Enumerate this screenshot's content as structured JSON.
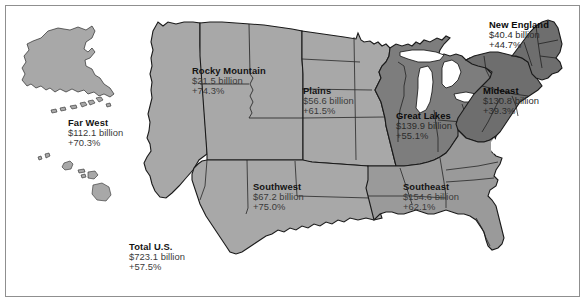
{
  "figure": {
    "type": "choropleth-map",
    "background_color": "#ffffff",
    "frame_color": "#8f8f8f"
  },
  "palette": {
    "land_light": "#a8a8a8",
    "land_mid": "#9a9a9a",
    "land_dark": "#7d7d7d",
    "land_darkest": "#6e6e6e",
    "outline": "#1a1a1a",
    "water": "#ffffff",
    "label_name": "#141414",
    "label_value": "#3a3a3a"
  },
  "regions": [
    {
      "id": "far-west",
      "name": "Far West",
      "value": "$112.1 billion",
      "percent": "+70.3%",
      "fill": "#a8a8a8",
      "label_on_dark": false
    },
    {
      "id": "rocky-mountain",
      "name": "Rocky Mountain",
      "value": "$21.5 billion",
      "percent": "+74.3%",
      "fill": "#a8a8a8",
      "label_on_dark": false
    },
    {
      "id": "plains",
      "name": "Plains",
      "value": "$56.6 billion",
      "percent": "+61.5%",
      "fill": "#a8a8a8",
      "label_on_dark": false
    },
    {
      "id": "great-lakes",
      "name": "Great Lakes",
      "value": "$139.9 billion",
      "percent": "+55.1%",
      "fill": "#7d7d7d",
      "label_on_dark": true
    },
    {
      "id": "new-england",
      "name": "New England",
      "value": "$40.4 billion",
      "percent": "+44.7%",
      "fill": "#6e6e6e",
      "label_on_dark": true
    },
    {
      "id": "mideast",
      "name": "Mideast",
      "value": "$130.8 billion",
      "percent": "+39.3%",
      "fill": "#6e6e6e",
      "label_on_dark": true
    },
    {
      "id": "southwest",
      "name": "Southwest",
      "value": "$67.2 billion",
      "percent": "+75.0%",
      "fill": "#a8a8a8",
      "label_on_dark": false
    },
    {
      "id": "southeast",
      "name": "Southeast",
      "value": "$154.6 billion",
      "percent": "+62.1%",
      "fill": "#9a9a9a",
      "label_on_dark": false
    }
  ],
  "total": {
    "id": "total-us",
    "name": "Total U.S.",
    "value": "$723.1 billion",
    "percent": "+57.5%"
  },
  "insets": [
    {
      "id": "alaska",
      "name": "Alaska"
    },
    {
      "id": "hawaii",
      "name": "Hawaii"
    }
  ]
}
